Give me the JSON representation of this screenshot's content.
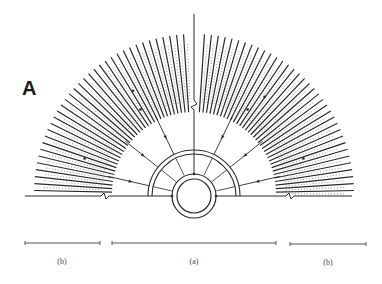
{
  "figure": {
    "panel_label": "A",
    "colors": {
      "ink": "#2a2a2a",
      "light_ink": "#555555",
      "background": "#ffffff"
    },
    "geometry": {
      "center": [
        194,
        196
      ],
      "inner_ring_radii": [
        17,
        22
      ],
      "outer_semicircle_radii": [
        42,
        46
      ],
      "hatch_inner_radius": 82,
      "hatch_outer_radius": 160,
      "hatch_line_count": 72,
      "baseline_y": 196,
      "baseline_x_range": [
        25,
        352
      ],
      "vertical_axis_top": 14,
      "zigzag_positions": {
        "vertical_y": 105,
        "baseline_left_x": 105,
        "baseline_right_x": 290
      },
      "converging_arrow_count": 7
    },
    "scale_bars": [
      {
        "id": "left",
        "label": "(b)",
        "x1": 25,
        "x2": 100,
        "y": 243
      },
      {
        "id": "center",
        "label": "(a)",
        "x1": 112,
        "x2": 276,
        "y": 243
      },
      {
        "id": "right",
        "label": "(b)",
        "x1": 290,
        "x2": 366,
        "y": 244
      }
    ]
  }
}
